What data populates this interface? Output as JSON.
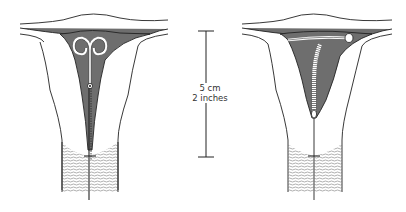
{
  "diagram": {
    "type": "medical-illustration",
    "figures": [
      {
        "name": "left-figure",
        "device": "loop-shaped IUD with double spiral top and thread through cervix"
      },
      {
        "name": "right-figure",
        "device": "coiled/spiral IUD with arm along fundus and thread through cervix"
      }
    ],
    "scale_bar": {
      "label_metric": "5 cm",
      "label_imperial": "2 inches"
    },
    "colors": {
      "cavity_fill": "#6e6e6e",
      "outline": "#222222",
      "background": "#ffffff"
    }
  }
}
